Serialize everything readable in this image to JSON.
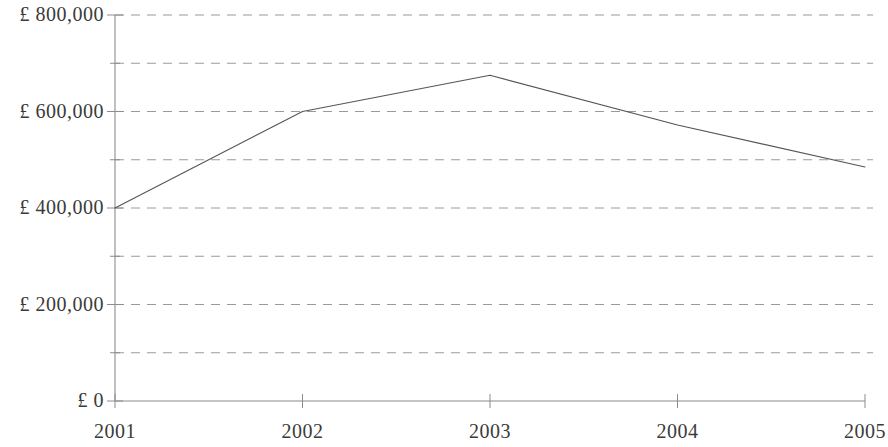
{
  "chart_data": {
    "type": "line",
    "title": "",
    "subtitle": "",
    "xlabel": "",
    "ylabel": "",
    "categories": [
      "2001",
      "2002",
      "2003",
      "2004",
      "2005"
    ],
    "x": [
      2001,
      2002,
      2003,
      2004,
      2005
    ],
    "values": [
      400000,
      600000,
      675000,
      572000,
      485000
    ],
    "series": [
      {
        "name": "",
        "values": [
          400000,
          600000,
          675000,
          572000,
          485000
        ]
      }
    ],
    "ylim": [
      0,
      800000
    ],
    "y_tick_step": 100000,
    "y_major_tick_labels": [
      "£ 800,000",
      "£ 600,000",
      "£ 400,000",
      "£ 200,000",
      "£ 0"
    ],
    "y_major_tick_values": [
      800000,
      600000,
      400000,
      200000,
      0
    ],
    "y_gridline_values": [
      800000,
      700000,
      600000,
      500000,
      400000,
      300000,
      200000,
      100000,
      0
    ],
    "x_tick_labels": [
      "2001",
      "2002",
      "2003",
      "2004",
      "2005"
    ],
    "grid": "horizontal-dashed",
    "legend": "none",
    "legend_position": "none",
    "annotations": [],
    "colors": {
      "line": "#555555",
      "gridline": "#9a9a9a",
      "axis": "#8c8c8c",
      "text": "#3b3b3b",
      "background": "#ffffff"
    }
  },
  "axes": {
    "y_labels": [
      {
        "text": "£ 800,000",
        "value": 800000
      },
      {
        "text": "£ 600,000",
        "value": 600000
      },
      {
        "text": "£ 400,000",
        "value": 400000
      },
      {
        "text": "£ 200,000",
        "value": 200000
      },
      {
        "text": "£ 0",
        "value": 0
      }
    ],
    "x_labels": [
      {
        "text": "2001",
        "value": 2001
      },
      {
        "text": "2002",
        "value": 2002
      },
      {
        "text": "2003",
        "value": 2003
      },
      {
        "text": "2004",
        "value": 2004
      },
      {
        "text": "2005",
        "value": 2005
      }
    ]
  }
}
